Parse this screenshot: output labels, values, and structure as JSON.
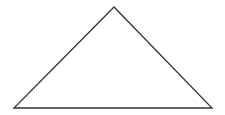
{
  "diagram": {
    "canvas": {
      "width": 225,
      "height": 115,
      "background": "#ffffff"
    },
    "shapes": [
      {
        "type": "triangle",
        "name": "triangle",
        "vertices": {
          "apex": [
            114,
            7
          ],
          "bottom_left": [
            14,
            108
          ],
          "bottom_right": [
            212,
            108
          ]
        },
        "points": "114,7 14,108 212,108",
        "stroke": "#333333",
        "stroke_width": 1.3,
        "fill": "none"
      }
    ]
  }
}
